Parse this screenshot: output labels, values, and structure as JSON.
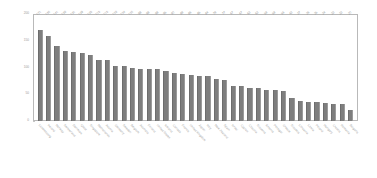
{
  "chart_data": {
    "type": "bar",
    "title": "",
    "subtitle": "",
    "xlabel": "",
    "ylabel": "",
    "ylim": [
      0,
      200
    ],
    "grid": false,
    "legend": "none",
    "bar_color": "#7e7e7e",
    "frame_color": "#b9b9b9",
    "label_color": "#9a9a9a",
    "yticks": [
      {
        "value": 200,
        "label": "200"
      },
      {
        "value": 150,
        "label": "150"
      },
      {
        "value": 100,
        "label": "100"
      },
      {
        "value": 50,
        "label": "50"
      },
      {
        "value": 0,
        "label": "0"
      }
    ],
    "categories": [
      "Luxembourg",
      "Ireland",
      "Norway",
      "Switzerland",
      "Denmark",
      "Qatar",
      "Singapore",
      "Netherlands",
      "Austria",
      "Germany",
      "Sweden",
      "Belgium",
      "Australia",
      "Finland",
      "United States",
      "Iceland",
      "Canada",
      "France",
      "United Kingdom",
      "Japan",
      "Italy",
      "New Zealand",
      "Spain",
      "Israel",
      "Cyprus",
      "Czechia",
      "Slovenia",
      "Estonia",
      "Portugal",
      "Greece",
      "Slovakia",
      "Lithuania",
      "Latvia",
      "Poland",
      "Hungary",
      "Croatia",
      "Romania",
      "Bulgaria"
    ],
    "values": [
      171,
      160,
      141,
      133,
      131,
      129,
      125,
      115,
      115,
      103,
      104,
      100,
      98,
      98,
      98,
      95,
      90,
      89,
      86,
      85,
      84,
      79,
      77,
      67,
      67,
      63,
      63,
      59,
      59,
      56,
      43,
      37,
      36,
      35,
      34,
      33,
      33,
      20
    ],
    "value_labels": [
      "171",
      "160",
      "141",
      "133",
      "131",
      "129",
      "125",
      "115",
      "115",
      "103",
      "104",
      "100",
      "98",
      "98",
      "98",
      "95",
      "90",
      "89",
      "86",
      "85",
      "84",
      "79",
      "77",
      "67",
      "67",
      "63",
      "63",
      "59",
      "59",
      "56",
      "43",
      "37",
      "36",
      "35",
      "34",
      "33",
      "33",
      "20"
    ]
  }
}
